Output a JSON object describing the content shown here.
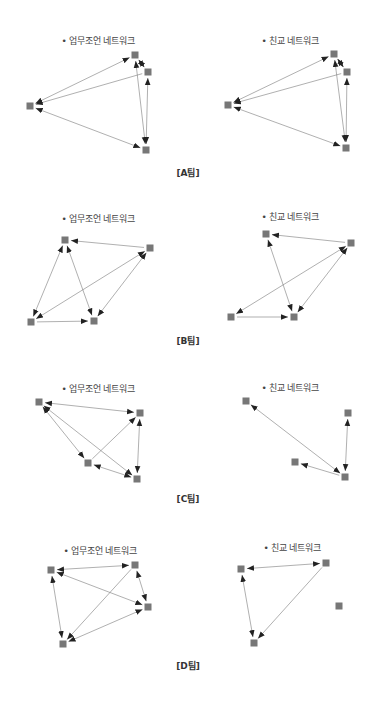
{
  "colors": {
    "node": "#777777",
    "edge": "#7a7a7a",
    "arrowhead": "#222222"
  },
  "teams": [
    {
      "label": "[A팀]",
      "label_pos": [
        188,
        172
      ],
      "panels": [
        {
          "kind": "work",
          "title": "• 업무조언 네트워크",
          "title_pos": [
            98,
            40
          ],
          "nodes": [
            [
              135,
              55
            ],
            [
              148,
              72
            ],
            [
              30,
              106
            ],
            [
              146,
              150
            ]
          ],
          "edges": [
            [
              0,
              1,
              true
            ],
            [
              1,
              2,
              false
            ],
            [
              2,
              0,
              true
            ],
            [
              2,
              3,
              true
            ],
            [
              0,
              3,
              true
            ],
            [
              1,
              3,
              true
            ]
          ]
        },
        {
          "kind": "friend",
          "title": "• 친교 네트워크",
          "title_pos": [
            290,
            40
          ],
          "nodes": [
            [
              334,
              54
            ],
            [
              347,
              72
            ],
            [
              228,
              105
            ],
            [
              346,
              148
            ]
          ],
          "edges": [
            [
              0,
              1,
              true
            ],
            [
              1,
              2,
              false
            ],
            [
              2,
              0,
              true
            ],
            [
              2,
              3,
              true
            ],
            [
              0,
              3,
              true
            ],
            [
              1,
              3,
              true
            ]
          ]
        }
      ]
    },
    {
      "label": "[B팀]",
      "label_pos": [
        188,
        340
      ],
      "panels": [
        {
          "kind": "work",
          "title": "• 업무조언 네트워크",
          "title_pos": [
            98,
            218
          ],
          "nodes": [
            [
              65,
              240
            ],
            [
              150,
              248
            ],
            [
              31,
              322
            ],
            [
              94,
              321
            ]
          ],
          "edges": [
            [
              1,
              0,
              false
            ],
            [
              0,
              2,
              true
            ],
            [
              0,
              3,
              true
            ],
            [
              2,
              3,
              false
            ],
            [
              1,
              2,
              true
            ],
            [
              1,
              3,
              true
            ]
          ]
        },
        {
          "kind": "friend",
          "title": "• 친교 네트워크",
          "title_pos": [
            290,
            216
          ],
          "nodes": [
            [
              266,
              234
            ],
            [
              351,
              243
            ],
            [
              231,
              317
            ],
            [
              294,
              317
            ]
          ],
          "edges": [
            [
              1,
              0,
              false
            ],
            [
              0,
              3,
              true
            ],
            [
              2,
              3,
              false
            ],
            [
              1,
              2,
              true
            ],
            [
              1,
              3,
              true
            ]
          ]
        }
      ]
    },
    {
      "label": "[C팀]",
      "label_pos": [
        188,
        498
      ],
      "panels": [
        {
          "kind": "work",
          "title": "• 업무조언 네트워크",
          "title_pos": [
            98,
            388
          ],
          "nodes": [
            [
              39,
              402
            ],
            [
              140,
              413
            ],
            [
              88,
              463
            ],
            [
              137,
              479
            ]
          ],
          "edges": [
            [
              0,
              1,
              true
            ],
            [
              0,
              2,
              true
            ],
            [
              0,
              3,
              true
            ],
            [
              2,
              1,
              false
            ],
            [
              2,
              3,
              true
            ],
            [
              1,
              3,
              true
            ]
          ]
        },
        {
          "kind": "friend",
          "title": "• 친교 네트워크",
          "title_pos": [
            290,
            387
          ],
          "nodes": [
            [
              246,
              401
            ],
            [
              348,
              413
            ],
            [
              295,
              462
            ],
            [
              345,
              477
            ]
          ],
          "edges": [
            [
              0,
              3,
              true
            ],
            [
              3,
              2,
              false
            ],
            [
              1,
              3,
              true
            ]
          ]
        }
      ]
    },
    {
      "label": "[D팀]",
      "label_pos": [
        188,
        665
      ],
      "panels": [
        {
          "kind": "work",
          "title": "• 업무조언 네트워크",
          "title_pos": [
            100,
            550
          ],
          "nodes": [
            [
              51,
              570
            ],
            [
              135,
              565
            ],
            [
              148,
              607
            ],
            [
              63,
              644
            ]
          ],
          "edges": [
            [
              0,
              1,
              true
            ],
            [
              0,
              2,
              true
            ],
            [
              0,
              3,
              true
            ],
            [
              1,
              3,
              false
            ],
            [
              1,
              2,
              true
            ],
            [
              3,
              2,
              true
            ]
          ]
        },
        {
          "kind": "friend",
          "title": "• 친교 네트워크",
          "title_pos": [
            292,
            547
          ],
          "nodes": [
            [
              241,
              569
            ],
            [
              326,
              563
            ],
            [
              339,
              606
            ],
            [
              254,
              643
            ]
          ],
          "edges": [
            [
              0,
              1,
              true
            ],
            [
              0,
              3,
              true
            ],
            [
              1,
              3,
              false
            ]
          ]
        }
      ]
    }
  ]
}
